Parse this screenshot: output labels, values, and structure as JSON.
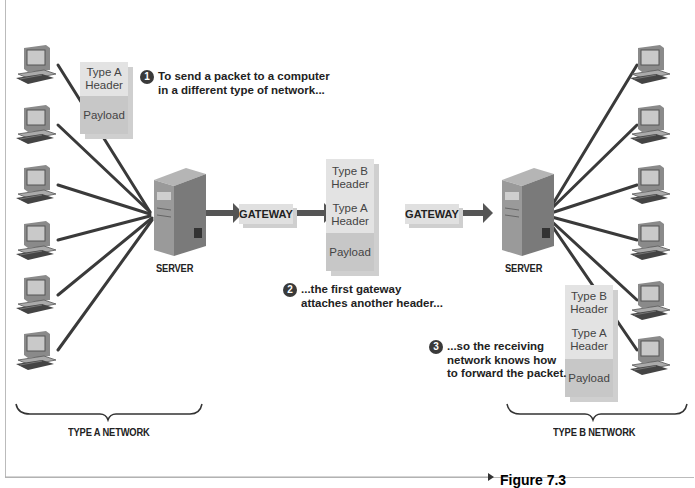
{
  "diagram": {
    "networks": [
      {
        "id": "a",
        "label": "TYPE A NETWORK",
        "computers": 6,
        "server_label": "SERVER"
      },
      {
        "id": "b",
        "label": "TYPE B NETWORK",
        "computers": 6,
        "server_label": "SERVER"
      }
    ],
    "gateways": [
      {
        "label": "GATEWAY"
      },
      {
        "label": "GATEWAY"
      }
    ],
    "packets": {
      "first": {
        "header_a": "Type A Header",
        "payload": "Payload"
      },
      "middle": {
        "header_b": "Type B Header",
        "header_a": "Type A Header",
        "payload": "Payload"
      },
      "last": {
        "header_b": "Type B Header",
        "header_a": "Type A Header",
        "payload": "Payload"
      }
    },
    "steps": [
      {
        "num": "1",
        "line1": "To send a packet to a computer",
        "line2": "in a different type of network..."
      },
      {
        "num": "2",
        "line1": "...the first gateway",
        "line2": "attaches another header..."
      },
      {
        "num": "3",
        "line1": "...so the receiving",
        "line2": "network knows how",
        "line3": "to forward the packet."
      }
    ],
    "figure_label": "Figure 7.3"
  },
  "icons": {
    "computer": "computer-icon",
    "server": "server-icon",
    "arrow": "arrow-right-icon",
    "brace": "brace-icon"
  },
  "colors": {
    "wire": "#3a3a3a",
    "header_fill": "#e3e3e3",
    "payload_fill": "#c7c7c7",
    "shadow": "#cfcfcf"
  }
}
